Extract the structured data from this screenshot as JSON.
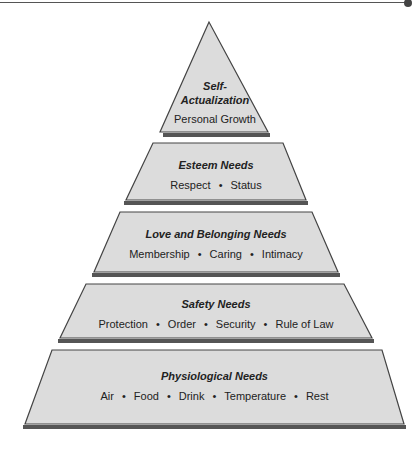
{
  "diagram": {
    "type": "pyramid",
    "colors": {
      "fill": "#dcdcdc",
      "stroke": "#444444",
      "shadow": "#555555",
      "text": "#222222"
    },
    "levels": [
      {
        "title": "Self-\nActualization",
        "title_line1": "Self-",
        "title_line2": "Actualization",
        "items_text": "Personal Growth"
      },
      {
        "title": "Esteem Needs",
        "items": [
          "Respect",
          "Status"
        ]
      },
      {
        "title": "Love and Belonging Needs",
        "items": [
          "Membership",
          "Caring",
          "Intimacy"
        ]
      },
      {
        "title": "Safety Needs",
        "items": [
          "Protection",
          "Order",
          "Security",
          "Rule of Law"
        ]
      },
      {
        "title": "Physiological Needs",
        "items": [
          "Air",
          "Food",
          "Drink",
          "Temperature",
          "Rest"
        ]
      }
    ],
    "separator": "•"
  }
}
